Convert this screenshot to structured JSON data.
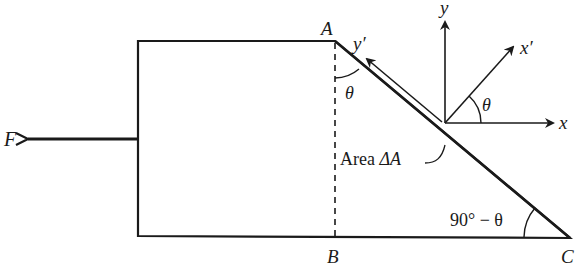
{
  "diagram": {
    "labels": {
      "force": "F",
      "point_a": "A",
      "point_b": "B",
      "point_c": "C",
      "axis_x": "x",
      "axis_y": "y",
      "axis_x_prime": "x′",
      "axis_y_prime": "y′",
      "theta_at_a": "θ",
      "theta_at_origin": "θ",
      "angle_at_c": "90° − θ",
      "area_label_prefix": "Area ",
      "area_label_symbol": "ΔA"
    },
    "colors": {
      "ink": "#1a1a1a",
      "background": "#ffffff"
    }
  }
}
